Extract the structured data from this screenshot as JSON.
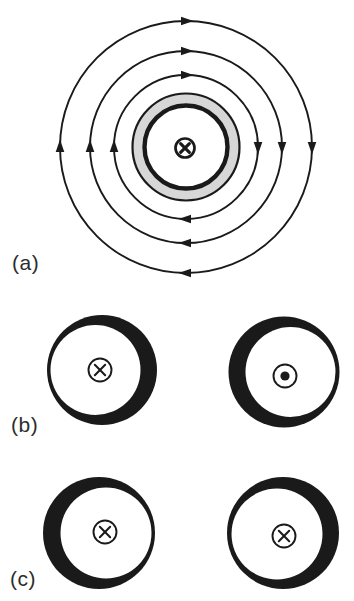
{
  "figure": {
    "background": "#ffffff",
    "ink": "#1a1a1a",
    "label_color": "#2d2d2d",
    "panels": [
      {
        "id": "a",
        "label": "(a)",
        "type": "field-line-diagram",
        "center": {
          "x": 186,
          "y": 147
        },
        "field_lines": {
          "radii": [
            72,
            96,
            126
          ],
          "direction": "clockwise",
          "arrows_per_circle": 4,
          "stroke_width": 1.9
        },
        "flux_ring": {
          "outer_r": 53.5,
          "inner_r": 41.5,
          "fill": "#d7d7d7",
          "outer_edge_width": 2.2,
          "inner_edge_width": 4.4
        },
        "current_symbol": {
          "glyph": "cross",
          "x": 185,
          "y": 148,
          "r": 9.5,
          "bold": true
        }
      },
      {
        "id": "b",
        "label": "(b)",
        "type": "ring-pair",
        "rings": [
          {
            "cx": 102,
            "cy": 370,
            "outer_r": 55,
            "inner_r": 45,
            "inner_dx": -6.5,
            "inner_dy": 0,
            "thick_side": "right",
            "symbol": {
              "glyph": "cross",
              "x": 100,
              "y": 370,
              "r": 11.5,
              "bold": false
            }
          },
          {
            "cx": 284,
            "cy": 372,
            "outer_r": 55.5,
            "inner_r": 45,
            "inner_dx": 6.5,
            "inner_dy": 0,
            "thick_side": "left",
            "symbol": {
              "glyph": "dot",
              "x": 285,
              "y": 376,
              "r": 11.5,
              "bold": false
            }
          }
        ]
      },
      {
        "id": "c",
        "label": "(c)",
        "type": "ring-pair",
        "rings": [
          {
            "cx": 99,
            "cy": 533,
            "outer_r": 56,
            "inner_r": 45.5,
            "inner_dx": 7,
            "inner_dy": 0,
            "thick_side": "left",
            "symbol": {
              "glyph": "cross",
              "x": 105,
              "y": 532,
              "r": 11.5,
              "bold": false
            }
          },
          {
            "cx": 283,
            "cy": 533,
            "outer_r": 56,
            "inner_r": 45.5,
            "inner_dx": -6,
            "inner_dy": 1,
            "thick_side": "right",
            "symbol": {
              "glyph": "cross",
              "x": 284,
              "y": 536,
              "r": 11.5,
              "bold": false
            }
          }
        ]
      }
    ]
  }
}
